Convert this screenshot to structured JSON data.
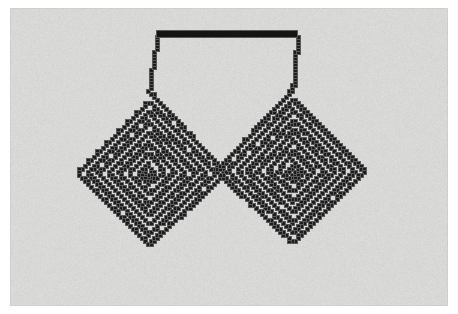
{
  "page": {
    "width": 458,
    "height": 314,
    "paper_color": "#ffffff",
    "caption": ""
  },
  "canvas": {
    "label": "pixelated-double-spiral-plot",
    "x": 10,
    "y": 8,
    "width": 438,
    "height": 298,
    "background_color": "#d8d8d6",
    "border_color": "#cfcfcd"
  },
  "figure": {
    "ink_color": "#1c1c1c",
    "ink_soft_color": "#5a5a5a",
    "pixel_block": 3,
    "band_spacing": 10.2,
    "stroke_style": "staircase-pixel-diagonal",
    "left_spiral": {
      "name": "left-spiral",
      "center_x": 148,
      "center_y": 172,
      "turns": 7,
      "chirality": "counter-clockwise",
      "tip_x": 23,
      "tip_y": 161
    },
    "right_spiral": {
      "name": "right-spiral",
      "center_x": 292,
      "center_y": 170,
      "turns": 7,
      "chirality": "clockwise",
      "tip_x": 420,
      "tip_y": 161
    },
    "top_bar": {
      "name": "top-connector-bar",
      "x1": 157,
      "y1": 31,
      "x2": 297,
      "y2": 37,
      "color": "#141414"
    },
    "extents": {
      "left": 23,
      "right": 420,
      "top": 31,
      "bottom": 286,
      "center_notch_y": 118,
      "center_cross_y": 172
    }
  },
  "chart_data": {
    "type": "line",
    "xlabel": "",
    "ylabel": "",
    "xlim": [
      0,
      458
    ],
    "ylim": [
      314,
      0
    ],
    "grid": false,
    "legend": null,
    "series": [
      {
        "name": "left-spiral-arm",
        "color": "#1c1c1c",
        "turns": 7,
        "center": [
          148,
          172
        ],
        "step": 10.2
      },
      {
        "name": "right-spiral-arm",
        "color": "#1c1c1c",
        "turns": 7,
        "center": [
          292,
          170
        ],
        "step": 10.2
      },
      {
        "name": "top-connector",
        "color": "#141414",
        "points": [
          [
            157,
            34
          ],
          [
            297,
            34
          ]
        ]
      }
    ]
  }
}
